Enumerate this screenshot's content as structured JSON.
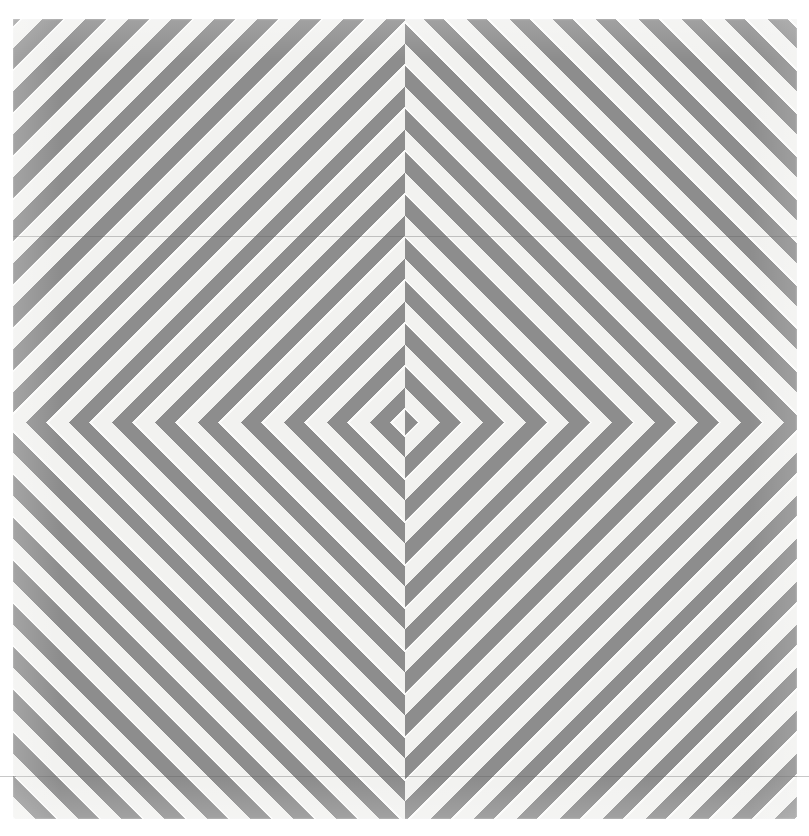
{
  "artwork": {
    "title": "Four-quadrant diagonal chevron stripe panel",
    "medium_note": "",
    "canvas": {
      "width_px": 809,
      "height_px": 836,
      "background_color": "#ffffff"
    },
    "panel": {
      "left_px": 13,
      "top_px": 19,
      "width_px": 784,
      "height_px": 800,
      "paper_color": "#f4f4f2"
    },
    "center_point": {
      "x_px": 405,
      "y_px": 422
    },
    "colors": {
      "stripe_dark": "#8d8d8d",
      "stripe_light": "#f2f2f0",
      "stripe_highlight": "#fbfbfa",
      "seam_line": "#5a5a5a",
      "page_background": "#ffffff"
    },
    "stripe_geometry": {
      "angle_degrees": 45,
      "perpendicular_period_px": 30.4,
      "dark_band_width_px": 13.6,
      "light_band_width_px": 16.8,
      "horizontal_period_px": 43,
      "dark_duty_fraction": 0.45
    },
    "quadrants": [
      {
        "id": "top-left",
        "stripe_direction": "ascending-right",
        "label": "TL"
      },
      {
        "id": "top-right",
        "stripe_direction": "descending-right",
        "label": "TR"
      },
      {
        "id": "bottom-left",
        "stripe_direction": "descending-right",
        "label": "BL"
      },
      {
        "id": "bottom-right",
        "stripe_direction": "ascending-right",
        "label": "BR"
      }
    ],
    "seams": [
      {
        "id": "upper-seam",
        "y_px": 236,
        "spans_full_width": false
      },
      {
        "id": "lower-seam",
        "y_px": 776,
        "spans_full_width": true
      }
    ]
  }
}
